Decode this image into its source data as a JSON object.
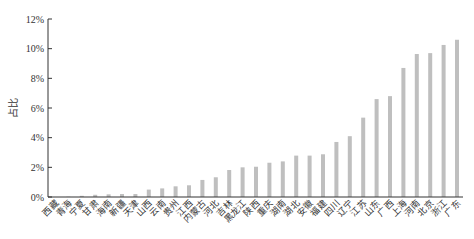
{
  "chart_data": {
    "type": "bar",
    "title": "",
    "xlabel": "",
    "ylabel": "占比",
    "ylim": [
      0,
      12
    ],
    "y_ticks": [
      "0%",
      "2%",
      "4%",
      "6%",
      "8%",
      "10%",
      "12%"
    ],
    "y_tick_values": [
      0,
      2,
      4,
      6,
      8,
      10,
      12
    ],
    "grid": false,
    "legend": "none",
    "bar_color": "#bfbfbf",
    "categories": [
      "西藏",
      "青海",
      "宁夏",
      "甘肃",
      "海南",
      "新疆",
      "天津",
      "山西",
      "云南",
      "贵州",
      "江西",
      "内蒙古",
      "河北",
      "吉林",
      "黑龙江",
      "陕西",
      "重庆",
      "湖南",
      "湖北",
      "安徽",
      "福建",
      "四川",
      "辽宁",
      "江苏",
      "山东",
      "广西",
      "上海",
      "河南",
      "北京",
      "浙江",
      "广东"
    ],
    "values": [
      0.0,
      0.02,
      0.08,
      0.15,
      0.18,
      0.2,
      0.2,
      0.5,
      0.58,
      0.72,
      0.79,
      1.15,
      1.33,
      1.82,
      2.0,
      2.04,
      2.31,
      2.4,
      2.79,
      2.79,
      2.88,
      3.71,
      4.1,
      5.35,
      6.6,
      6.8,
      8.7,
      9.64,
      9.7,
      10.25,
      10.6
    ],
    "unit": "%"
  }
}
